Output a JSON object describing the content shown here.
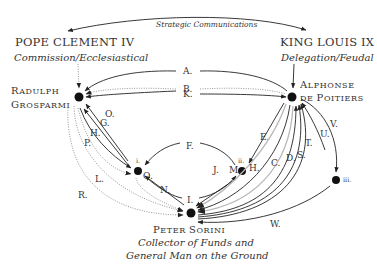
{
  "header": {
    "strategic_link": "Strategic Communications"
  },
  "actors": {
    "pope": {
      "name": "POPE CLEMENT IV",
      "role": "Commission/Ecclesiastical"
    },
    "king": {
      "name": "KING LOUIS IX",
      "role": "Delegation/Feudal"
    },
    "radulph": {
      "line1_cap": "R",
      "line1_rest": "ADULPH",
      "line2_cap": "G",
      "line2_rest": "ROSPARMI"
    },
    "alphonse": {
      "line1_cap": "A",
      "line1_rest": "LPHONSE",
      "line2_a": "DE ",
      "line2_cap": "P",
      "line2_rest": "OITIERS"
    },
    "peter": {
      "cap1": "P",
      "rest1": "ETER ",
      "cap2": "S",
      "rest2": "ORINI",
      "role_line1": "Collector of Funds and",
      "role_line2": "General Man on the Ground"
    }
  },
  "intermediary_nodes": {
    "i": "i.",
    "ii": "ii.",
    "iii": "iii."
  },
  "edges": {
    "A": "A.",
    "B": "B.",
    "C": "C.",
    "D": "D.",
    "E": "E.",
    "F": "F.",
    "G": "G.",
    "H_left": "H.",
    "H_right": "H.",
    "I": "I.",
    "J": "J.",
    "K": "K.",
    "L": "L.",
    "M": "M.",
    "N": "N.",
    "O": "O.",
    "P": "P.",
    "Q": "Q.",
    "R": "R.",
    "S": "S.",
    "T": "T.",
    "U": "U.",
    "V": "V.",
    "W": "W."
  },
  "colors": {
    "ink": "#222222",
    "gray_line": "#b8b8b8",
    "dotted_line": "#999999",
    "text": "#333333"
  }
}
